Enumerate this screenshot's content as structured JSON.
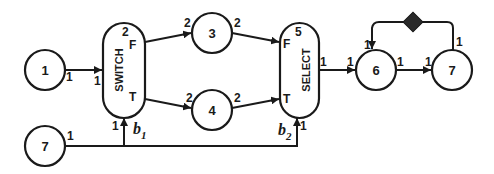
{
  "diagram": {
    "type": "dataflow-graph",
    "nodes": [
      {
        "id": "n1",
        "label": "1",
        "kind": "actor"
      },
      {
        "id": "switch",
        "label": "SWITCH",
        "kind": "switch",
        "tag": "2",
        "ports": {
          "false": "F",
          "true": "T"
        }
      },
      {
        "id": "n3",
        "label": "3",
        "kind": "actor"
      },
      {
        "id": "n4",
        "label": "4",
        "kind": "actor"
      },
      {
        "id": "select",
        "label": "SELECT",
        "kind": "select",
        "tag": "5",
        "ports": {
          "false": "F",
          "true": "T"
        }
      },
      {
        "id": "n6",
        "label": "6",
        "kind": "actor"
      },
      {
        "id": "n7a",
        "label": "7",
        "kind": "actor"
      },
      {
        "id": "n7b",
        "label": "7",
        "kind": "actor"
      }
    ],
    "edges": [
      {
        "from": "n1",
        "to": "switch",
        "produce": "1",
        "consume": "1"
      },
      {
        "from": "switch.F",
        "to": "n3",
        "produce": "",
        "consume": "2"
      },
      {
        "from": "switch.T",
        "to": "n4",
        "produce": "",
        "consume": "2"
      },
      {
        "from": "n3",
        "to": "select.F",
        "produce": "2",
        "consume": ""
      },
      {
        "from": "n4",
        "to": "select.T",
        "produce": "2",
        "consume": ""
      },
      {
        "from": "select",
        "to": "n6",
        "produce": "1",
        "consume": "1"
      },
      {
        "from": "n6",
        "to": "n7a",
        "produce": "1",
        "consume": "1"
      },
      {
        "from": "n7a",
        "to": "n6",
        "produce": "1",
        "consume": "1",
        "delay": true
      },
      {
        "from": "n7b",
        "to": "switch.control",
        "produce": "1",
        "consume": "1",
        "control_label": "b",
        "control_sub": "1"
      },
      {
        "from": "n7b",
        "to": "select.control",
        "produce": "1",
        "consume": "1",
        "control_label": "b",
        "control_sub": "2"
      }
    ],
    "rate_labels": {
      "n1_out": "1",
      "switch_in": "1",
      "switch_tag": "2",
      "n3_in": "2",
      "n3_out": "2",
      "n4_in": "2",
      "n4_out": "2",
      "select_tag": "5",
      "select_out": "1",
      "n6_in": "1",
      "n6_out": "1",
      "n6_fb_in": "1",
      "n7a_in": "1",
      "n7a_fb_out": "1",
      "n7b_out": "1",
      "switch_ctrl_in": "1",
      "select_ctrl_in": "1"
    },
    "port_labels": {
      "switch_f": "F",
      "switch_t": "T",
      "select_f": "F",
      "select_t": "T"
    },
    "control_labels": {
      "b1": "b",
      "b1_sub": "1",
      "b2": "b",
      "b2_sub": "2"
    }
  }
}
